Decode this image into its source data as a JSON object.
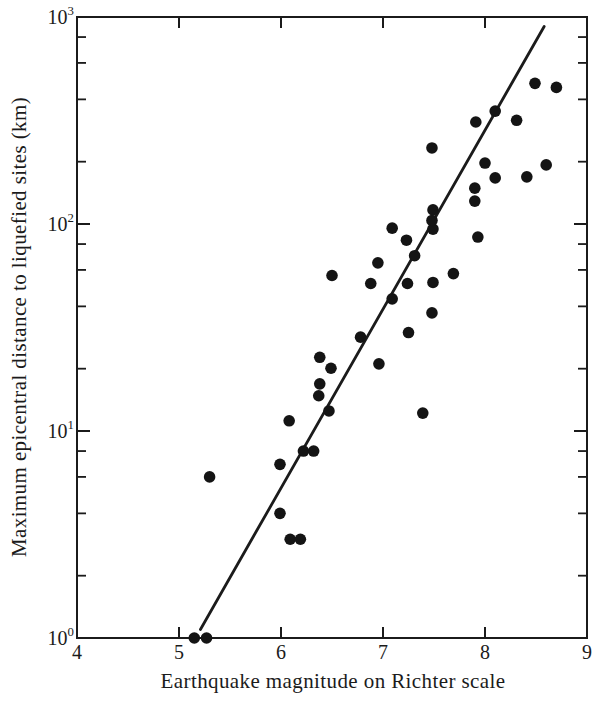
{
  "figure": {
    "background": "#ffffff",
    "ink": "#1b1b1b",
    "dot_color": "#141414"
  },
  "chart_data": {
    "type": "scatter",
    "title": "",
    "xlabel": "Earthquake magnitude on Richter scale",
    "ylabel": "Maximum epicentral distance to liquefied sites (km)",
    "x_axis": {
      "scale": "linear",
      "min": 4,
      "max": 9,
      "tick_values": [
        4,
        5,
        6,
        7,
        8,
        9
      ],
      "tick_labels": [
        "4",
        "5",
        "6",
        "7",
        "8",
        "9"
      ],
      "inner_tick_values": [
        5,
        6,
        7,
        8
      ]
    },
    "y_axis": {
      "scale": "log",
      "min": 1,
      "max": 1000,
      "major_ticks": [
        {
          "value": 1,
          "base": "10",
          "exp": "0"
        },
        {
          "value": 10,
          "base": "10",
          "exp": "1"
        },
        {
          "value": 100,
          "base": "10",
          "exp": "2"
        },
        {
          "value": 1000,
          "base": "10",
          "exp": "3"
        }
      ],
      "minor_tick_multipliers": [
        2,
        4,
        6,
        8
      ],
      "minor_tick_decades": [
        1,
        10,
        100
      ]
    },
    "grid": false,
    "legend": false,
    "marker": {
      "shape": "circle",
      "radius_px": 5.8
    },
    "points": [
      [
        5.15,
        1.0
      ],
      [
        5.27,
        1.0
      ],
      [
        6.09,
        3.0
      ],
      [
        6.19,
        3.0
      ],
      [
        5.99,
        4.0
      ],
      [
        5.3,
        6.0
      ],
      [
        5.99,
        6.9
      ],
      [
        6.22,
        8.0
      ],
      [
        6.32,
        8.0
      ],
      [
        6.08,
        11.2
      ],
      [
        6.47,
        12.5
      ],
      [
        7.39,
        12.2
      ],
      [
        6.37,
        14.8
      ],
      [
        6.38,
        16.9
      ],
      [
        6.49,
        20.1
      ],
      [
        6.38,
        22.7
      ],
      [
        6.96,
        21.1
      ],
      [
        6.78,
        28.4
      ],
      [
        7.25,
        29.9
      ],
      [
        7.48,
        37.2
      ],
      [
        7.09,
        43.5
      ],
      [
        6.88,
        51.6
      ],
      [
        7.24,
        51.6
      ],
      [
        7.49,
        52.2
      ],
      [
        6.5,
        56.4
      ],
      [
        7.69,
        57.6
      ],
      [
        6.95,
        64.9
      ],
      [
        7.31,
        70.3
      ],
      [
        7.23,
        83.5
      ],
      [
        7.93,
        86.5
      ],
      [
        7.09,
        95.5
      ],
      [
        7.49,
        94.5
      ],
      [
        7.48,
        104
      ],
      [
        7.49,
        117
      ],
      [
        7.9,
        129
      ],
      [
        7.9,
        149
      ],
      [
        8.0,
        197
      ],
      [
        8.1,
        167
      ],
      [
        8.41,
        169
      ],
      [
        8.6,
        193
      ],
      [
        7.48,
        233
      ],
      [
        7.91,
        311
      ],
      [
        8.1,
        351
      ],
      [
        8.31,
        317
      ],
      [
        8.49,
        478
      ],
      [
        8.7,
        457
      ]
    ],
    "trend_line": {
      "m1": 5.21,
      "d1": 1.1,
      "m2": 8.58,
      "d2": 900
    }
  }
}
